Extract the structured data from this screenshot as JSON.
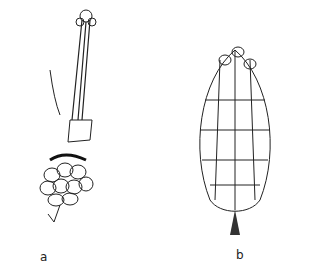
{
  "figure": {
    "panels": [
      {
        "label": "a",
        "subject": "shoot with male cone cluster"
      },
      {
        "label": "b",
        "subject": "female cone"
      }
    ]
  }
}
